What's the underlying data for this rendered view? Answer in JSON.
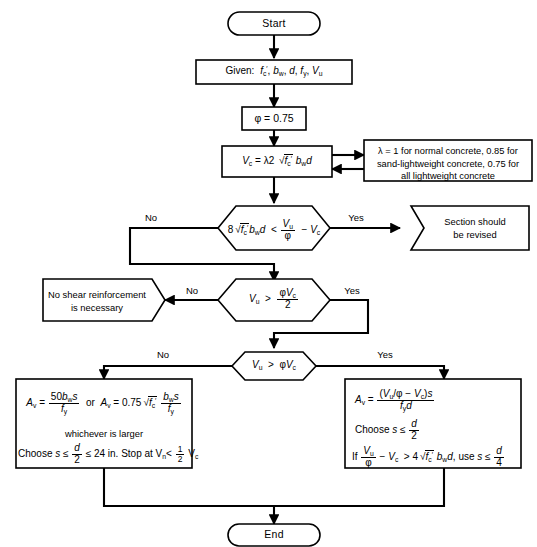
{
  "diagram": {
    "background_color": "#ffffff",
    "line_color": "#000000"
  },
  "nodes": {
    "start": {
      "label": "Start",
      "shape": "terminator"
    },
    "given": {
      "label_prefix": "Given:",
      "variables": "f'c, bw, d, fy, Vu",
      "shape": "process"
    },
    "phi": {
      "label": "φ = 0.75",
      "shape": "process"
    },
    "vc": {
      "label": "Vc = λ2 √f'c bw d",
      "shape": "process"
    },
    "lambda_note": {
      "line1": "λ = 1 for normal concrete, 0.85 for",
      "line2": "sand-lightweight concrete, 0.75 for",
      "line3": "all lightweight concrete",
      "shape": "note"
    },
    "decision1": {
      "label": "8√f'c bw d < Vu/φ − Vc",
      "shape": "decision"
    },
    "revise": {
      "line1": "Section should",
      "line2": "be revised",
      "shape": "arrow-box"
    },
    "decision2": {
      "label": "Vu > φVc/2",
      "shape": "decision"
    },
    "no_shear": {
      "line1": "No shear reinforcement",
      "line2": "is necessary",
      "shape": "arrow-box"
    },
    "decision3": {
      "label": "Vu > φVc",
      "shape": "decision"
    },
    "min_shear": {
      "formula1": "Av = 50bw s / fy",
      "or_text": "or",
      "formula2": "Av = 0.75√f'c  bw s / fy",
      "line_whichever": "whichever is larger",
      "line_choose": "Choose s ≤ d/2 ≤ 24 in. Stop at Vn < ½ Vc",
      "shape": "process"
    },
    "calc_shear": {
      "formula1": "Av = (Vu/φ − Vc)s / (fy d)",
      "line_choose": "Choose s ≤ d/2",
      "line_if": "If Vu/φ − Vc > 4√f'c bw d, use s ≤ d/4",
      "shape": "process"
    },
    "end": {
      "label": "End",
      "shape": "terminator"
    }
  },
  "branch_labels": {
    "d1_no": "No",
    "d1_yes": "Yes",
    "d2_no": "No",
    "d2_yes": "Yes",
    "d3_no": "No",
    "d3_yes": "Yes"
  },
  "symbols": {
    "phi": "φ",
    "lambda": "λ",
    "radical": "√",
    "less_than": "<",
    "greater_than": ">",
    "leq": "≤",
    "minus": "−"
  }
}
